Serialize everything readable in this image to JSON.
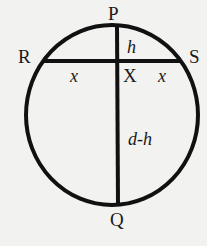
{
  "diagram": {
    "type": "circle-chord-geometry",
    "background": "#f2f2f0",
    "stroke_color": "#111111",
    "points": {
      "P": "P",
      "Q": "Q",
      "R": "R",
      "S": "S",
      "X": "X"
    },
    "segment_labels": {
      "PX": "h",
      "RX": "x",
      "XS": "x",
      "XQ": "d-h"
    },
    "elements": [
      {
        "kind": "circle",
        "description": "circle with top point P and bottom point Q"
      },
      {
        "kind": "chord",
        "from": "R",
        "to": "S",
        "description": "horizontal chord RS"
      },
      {
        "kind": "diameter",
        "from": "P",
        "to": "Q",
        "description": "vertical diameter PQ intersecting RS at X"
      }
    ]
  }
}
